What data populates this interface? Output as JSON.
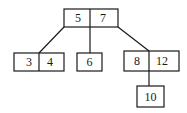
{
  "diagram": {
    "type": "b-tree",
    "nodes": {
      "root": {
        "keys": [
          "5",
          "7"
        ]
      },
      "left": {
        "keys": [
          "3",
          "4"
        ]
      },
      "middle": {
        "keys": [
          "6"
        ]
      },
      "right": {
        "keys": [
          "8",
          "12"
        ]
      },
      "right_child": {
        "keys": [
          "10"
        ]
      }
    },
    "edges": [
      {
        "from": "root",
        "to": "left"
      },
      {
        "from": "root",
        "to": "middle"
      },
      {
        "from": "root",
        "to": "right"
      },
      {
        "from": "right",
        "to": "right_child"
      }
    ]
  }
}
